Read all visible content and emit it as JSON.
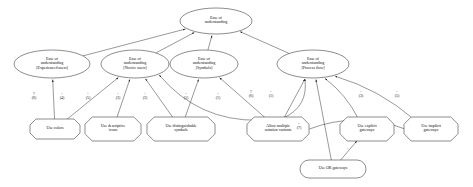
{
  "diagram": {
    "type": "goal-contribution-graph",
    "colors": {
      "stroke": "#1a1a1a",
      "fill": "#ffffff",
      "text": "#111111"
    },
    "nodes": [
      {
        "id": "root",
        "shape": "ellipse",
        "label": "Ease of\nunderstanding",
        "x": 180,
        "y": 8,
        "w": 72,
        "h": 26
      },
      {
        "id": "exp",
        "shape": "ellipse",
        "label": "Ease of\nunderstanding\n[Experienced users]",
        "x": 14,
        "y": 50,
        "w": 76,
        "h": 28
      },
      {
        "id": "novice",
        "shape": "ellipse",
        "label": "Ease of\nunderstanding\n[Novice users]",
        "x": 101,
        "y": 50,
        "w": 68,
        "h": 28
      },
      {
        "id": "symbols",
        "shape": "ellipse",
        "label": "Ease of\nunderstanding\n[Symbols]",
        "x": 170,
        "y": 50,
        "w": 68,
        "h": 28
      },
      {
        "id": "procflow",
        "shape": "ellipse",
        "label": "Ease of\nunderstanding\n[Process flow]",
        "x": 277,
        "y": 50,
        "w": 72,
        "h": 28
      },
      {
        "id": "colors",
        "shape": "octagon",
        "label": "Use colors",
        "x": 30,
        "y": 119,
        "w": 50,
        "h": 20
      },
      {
        "id": "icons",
        "shape": "octagon",
        "label": "Use descriptive\nicons",
        "x": 85,
        "y": 117,
        "w": 56,
        "h": 24
      },
      {
        "id": "distsym",
        "shape": "octagon",
        "label": "Use distinguishable\nsymbols",
        "x": 147,
        "y": 117,
        "w": 68,
        "h": 24
      },
      {
        "id": "variants",
        "shape": "octagon",
        "label": "Allow multiple\nnotation variants",
        "x": 247,
        "y": 117,
        "w": 62,
        "h": 24
      },
      {
        "id": "explicit",
        "shape": "octagon",
        "label": "Use explicit\ngateways",
        "x": 340,
        "y": 117,
        "w": 54,
        "h": 24
      },
      {
        "id": "implicit",
        "shape": "octagon",
        "label": "Use implicit\ngateways",
        "x": 404,
        "y": 117,
        "w": 54,
        "h": 24
      },
      {
        "id": "orgw",
        "shape": "rounded",
        "label": "Use OR gateways",
        "x": 300,
        "y": 160,
        "w": 66,
        "h": 18
      }
    ],
    "edge_labels": [
      {
        "id": "l1",
        "sign": "?",
        "count": "(6)",
        "x": 34,
        "y": 92,
        "from": "colors",
        "to": "exp"
      },
      {
        "id": "l2",
        "sign": "+",
        "count": "(4)",
        "x": 62,
        "y": 92,
        "from": "colors",
        "to": "novice"
      },
      {
        "id": "l3",
        "sign": "+",
        "count": "(5)",
        "x": 88,
        "y": 92,
        "from": "icons",
        "to": "novice"
      },
      {
        "id": "l4",
        "sign": "+",
        "count": "(3)",
        "x": 118,
        "y": 92,
        "from": "distsym",
        "to": "novice"
      },
      {
        "id": "l5",
        "sign": "+",
        "count": "(2)",
        "x": 145,
        "y": 92,
        "from": "distsym",
        "to": "symbols"
      },
      {
        "id": "l6",
        "sign": "-",
        "count": "(1)",
        "x": 186,
        "y": 92,
        "from": "variants",
        "to": "symbols"
      },
      {
        "id": "l7",
        "sign": "+",
        "count": "(1)",
        "x": 218,
        "y": 92,
        "from": "variants",
        "to": "novice"
      },
      {
        "id": "l8",
        "sign": "?",
        "count": "(6)",
        "x": 251,
        "y": 90,
        "from": "variants",
        "to": "procflow"
      },
      {
        "id": "l9",
        "sign": "-",
        "count": "(1)",
        "x": 271,
        "y": 90,
        "from": "variants",
        "to": "procflow"
      },
      {
        "id": "l10",
        "sign": "+",
        "count": "(3)",
        "x": 361,
        "y": 90,
        "from": "explicit",
        "to": "procflow"
      },
      {
        "id": "l11",
        "sign": "-",
        "count": "(5)",
        "x": 397,
        "y": 90,
        "from": "implicit",
        "to": "procflow"
      },
      {
        "id": "l12",
        "sign": "-",
        "count": "(7)",
        "x": 299,
        "y": 122,
        "from": "orgw",
        "to": "procflow"
      },
      {
        "id": "l13",
        "sign": "+",
        "count": "",
        "x": 348,
        "y": 147,
        "from": "orgw",
        "to": "explicit"
      }
    ],
    "edges": [
      {
        "from": "exp",
        "to": "root",
        "kind": "contribution"
      },
      {
        "from": "novice",
        "to": "root",
        "kind": "contribution"
      },
      {
        "from": "symbols",
        "to": "root",
        "kind": "contribution"
      },
      {
        "from": "procflow",
        "to": "root",
        "kind": "contribution"
      },
      {
        "from": "colors",
        "to": "exp",
        "kind": "?"
      },
      {
        "from": "colors",
        "to": "novice",
        "kind": "+"
      },
      {
        "from": "icons",
        "to": "novice",
        "kind": "+"
      },
      {
        "from": "distsym",
        "to": "novice",
        "kind": "+"
      },
      {
        "from": "distsym",
        "to": "symbols",
        "kind": "+"
      },
      {
        "from": "variants",
        "to": "symbols",
        "kind": "-"
      },
      {
        "from": "variants",
        "to": "novice",
        "kind": "+"
      },
      {
        "from": "variants",
        "to": "procflow",
        "kind": "?"
      },
      {
        "from": "variants",
        "to": "procflow",
        "kind": "-"
      },
      {
        "from": "explicit",
        "to": "procflow",
        "kind": "+"
      },
      {
        "from": "implicit",
        "to": "procflow",
        "kind": "-"
      },
      {
        "from": "orgw",
        "to": "procflow",
        "kind": "-"
      },
      {
        "from": "orgw",
        "to": "explicit",
        "kind": "+"
      },
      {
        "from": "implicit",
        "to": "variants",
        "kind": "plain"
      }
    ]
  }
}
